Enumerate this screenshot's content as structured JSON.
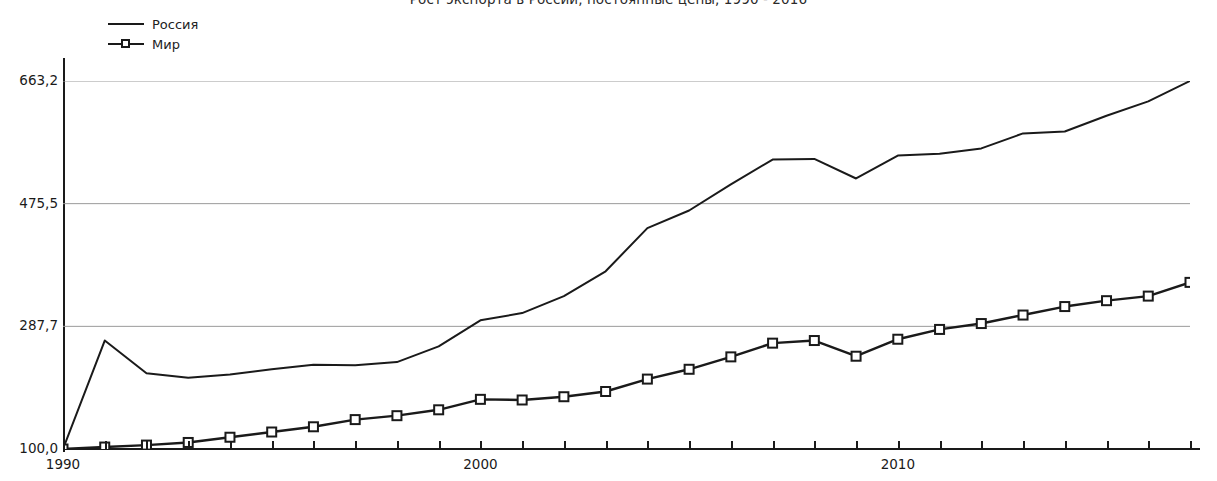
{
  "chart_data": {
    "type": "line",
    "title": "Рост экспорта в России, постоянные цены, 1990 - 2016",
    "xlabel": "",
    "ylabel": "",
    "grid": true,
    "legend_position": "top-left",
    "xlim": [
      1990,
      2017
    ],
    "ylim": [
      100.0,
      663.2
    ],
    "y_ticks": [
      "100,0",
      "287,7",
      "475,5",
      "663,2"
    ],
    "y_tick_values": [
      100.0,
      287.7,
      475.5,
      663.2
    ],
    "x_ticks": [
      "1990",
      "2000",
      "2010"
    ],
    "x_tick_values": [
      1990,
      2000,
      2010
    ],
    "x": [
      1990,
      1991,
      1992,
      1993,
      1994,
      1995,
      1996,
      1997,
      1998,
      1999,
      2000,
      2001,
      2002,
      2003,
      2004,
      2005,
      2006,
      2007,
      2008,
      2009,
      2010,
      2011,
      2012,
      2013,
      2014,
      2015,
      2016,
      2017
    ],
    "series": [
      {
        "name": "Россия",
        "marker": "none",
        "color": "#1a1a1a",
        "values": [
          100.0,
          266.0,
          216.0,
          209.0,
          214.0,
          222.0,
          229.0,
          228.0,
          233.0,
          257.0,
          297.0,
          308.0,
          334.0,
          372.0,
          438.0,
          465.0,
          505.0,
          543.0,
          544.0,
          514.0,
          549.0,
          552.0,
          560.0,
          583.0,
          586.0,
          610.0,
          632.0,
          663.2
        ]
      },
      {
        "name": "Мир",
        "marker": "square",
        "color": "#1a1a1a",
        "values": [
          100.0,
          103.0,
          106.0,
          110.0,
          118.0,
          126.0,
          134.0,
          145.0,
          151.0,
          160.0,
          176.0,
          175.0,
          180.0,
          188.0,
          207.0,
          222.0,
          241.0,
          262.0,
          266.0,
          242.0,
          268.0,
          283.0,
          292.0,
          305.0,
          318.0,
          327.0,
          334.0,
          355.0
        ]
      }
    ]
  },
  "legend": {
    "items": [
      {
        "label": "Россия",
        "marker": "line"
      },
      {
        "label": "Мир",
        "marker": "line-square"
      }
    ]
  }
}
